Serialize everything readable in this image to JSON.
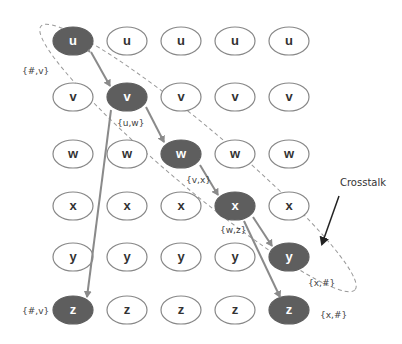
{
  "diagram": {
    "columns": [
      73,
      127,
      181,
      235,
      289
    ],
    "rows": [
      {
        "label": "u",
        "y": 41
      },
      {
        "label": "v",
        "y": 97
      },
      {
        "label": "w",
        "y": 154
      },
      {
        "label": "x",
        "y": 206
      },
      {
        "label": "y",
        "y": 257
      },
      {
        "label": "z",
        "y": 310
      }
    ],
    "highlighted": [
      {
        "row": 0,
        "col": 0
      },
      {
        "row": 1,
        "col": 1
      },
      {
        "row": 2,
        "col": 2
      },
      {
        "row": 3,
        "col": 3
      },
      {
        "row": 4,
        "col": 4
      },
      {
        "row": 5,
        "col": 0
      },
      {
        "row": 5,
        "col": 4
      }
    ],
    "annotations": [
      {
        "text": "{#,v}",
        "x": 22,
        "y": 74
      },
      {
        "text": "{u,w}",
        "x": 117,
        "y": 126
      },
      {
        "text": "{v,x}",
        "x": 186,
        "y": 183
      },
      {
        "text": "{w,z}",
        "x": 220,
        "y": 233
      },
      {
        "text": "{x,#}",
        "x": 308,
        "y": 286
      },
      {
        "text": "{#,v}",
        "x": 22,
        "y": 314
      },
      {
        "text": "{x,#}",
        "x": 320,
        "y": 318
      }
    ],
    "callout": {
      "text": "Crosstalk",
      "x": 340,
      "y": 186
    },
    "colors": {
      "highlight_fill": "#5e5e5e",
      "node_stroke": "#888888",
      "arrow": "#8a8a8a",
      "dashed": "#999999",
      "callout_arrow": "#222222"
    }
  }
}
